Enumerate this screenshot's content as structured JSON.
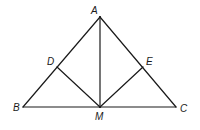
{
  "figure": {
    "type": "geometry",
    "stroke_color": "#1a1a1a",
    "background": "#ffffff"
  },
  "points": {
    "A": {
      "label": "A",
      "x": 100,
      "y": 17,
      "lx": 91,
      "ly": 14
    },
    "B": {
      "label": "B",
      "x": 23,
      "y": 107,
      "lx": 13,
      "ly": 111
    },
    "C": {
      "label": "C",
      "x": 176,
      "y": 107,
      "lx": 180,
      "ly": 112
    },
    "M": {
      "label": "M",
      "x": 100,
      "y": 107,
      "lx": 95,
      "ly": 120
    },
    "D": {
      "label": "D",
      "x": 57,
      "y": 67,
      "lx": 47,
      "ly": 65
    },
    "E": {
      "label": "E",
      "x": 143,
      "y": 67,
      "lx": 146,
      "ly": 65
    }
  },
  "segments": [
    {
      "from": "A",
      "to": "B"
    },
    {
      "from": "A",
      "to": "C"
    },
    {
      "from": "B",
      "to": "C"
    },
    {
      "from": "A",
      "to": "M"
    },
    {
      "from": "D",
      "to": "M"
    },
    {
      "from": "E",
      "to": "M"
    }
  ]
}
